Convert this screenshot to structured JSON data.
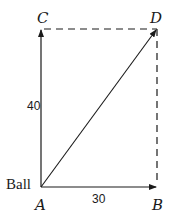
{
  "diagram": {
    "type": "vector-addition",
    "points": {
      "A": {
        "label": "A",
        "x": 41,
        "y": 187
      },
      "B": {
        "label": "B",
        "x": 157,
        "y": 187
      },
      "C": {
        "label": "C",
        "x": 41,
        "y": 29
      },
      "D": {
        "label": "D",
        "x": 157,
        "y": 29
      }
    },
    "object_label": "Ball",
    "vectors": [
      {
        "from": "A",
        "to": "C",
        "magnitude_label": "40",
        "style": "solid"
      },
      {
        "from": "A",
        "to": "B",
        "magnitude_label": "30",
        "style": "solid"
      },
      {
        "from": "A",
        "to": "D",
        "magnitude_label": "",
        "style": "solid",
        "role": "resultant"
      }
    ],
    "guides": [
      {
        "from": "C",
        "to": "D",
        "style": "dashed"
      },
      {
        "from": "B",
        "to": "D",
        "style": "dashed"
      }
    ],
    "colors": {
      "stroke": "#1a1a1a",
      "background": "#ffffff"
    }
  }
}
